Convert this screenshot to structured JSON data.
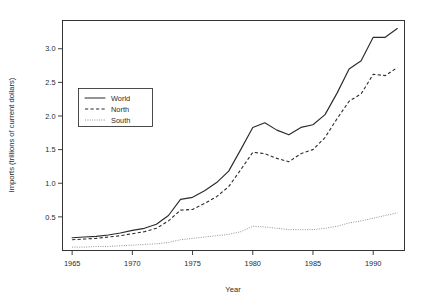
{
  "chart_data": {
    "type": "line",
    "title": "",
    "xlabel": "Year",
    "ylabel": "Imports (trillions of current dollars)",
    "xlim": [
      1964.2,
      1992.6
    ],
    "ylim": [
      0.0,
      3.42
    ],
    "xticks": [
      1965,
      1970,
      1975,
      1980,
      1985,
      1990
    ],
    "xtick_labels": [
      "1965",
      "1970",
      "1975",
      "1980",
      "1985",
      "1990"
    ],
    "yticks": [
      0.5,
      1.0,
      1.5,
      2.0,
      2.5,
      3.0
    ],
    "ytick_labels": [
      "0.5",
      "1.0",
      "1.5",
      "2.0",
      "2.5",
      "3.0"
    ],
    "grid": false,
    "legend_position": "upper-left-inset",
    "x": [
      1965,
      1966,
      1967,
      1968,
      1969,
      1970,
      1971,
      1972,
      1973,
      1974,
      1975,
      1976,
      1977,
      1978,
      1979,
      1980,
      1981,
      1982,
      1983,
      1984,
      1985,
      1986,
      1987,
      1988,
      1989,
      1990,
      1991,
      1992
    ],
    "series": [
      {
        "name": "World",
        "style": "solid",
        "color": "#2b2b2b",
        "values": [
          0.19,
          0.2,
          0.21,
          0.23,
          0.26,
          0.3,
          0.33,
          0.39,
          0.52,
          0.76,
          0.79,
          0.89,
          1.01,
          1.18,
          1.5,
          1.83,
          1.9,
          1.79,
          1.72,
          1.83,
          1.87,
          2.02,
          2.34,
          2.7,
          2.82,
          3.17,
          3.17,
          3.3
        ]
      },
      {
        "name": "North",
        "style": "dashed",
        "color": "#2b2b2b",
        "values": [
          0.16,
          0.17,
          0.18,
          0.2,
          0.22,
          0.25,
          0.28,
          0.33,
          0.44,
          0.6,
          0.61,
          0.7,
          0.8,
          0.95,
          1.2,
          1.46,
          1.44,
          1.37,
          1.32,
          1.44,
          1.5,
          1.68,
          1.96,
          2.22,
          2.33,
          2.62,
          2.6,
          2.72
        ]
      },
      {
        "name": "South",
        "style": "dotted",
        "color": "#8d8d8d",
        "values": [
          0.05,
          0.05,
          0.06,
          0.06,
          0.07,
          0.08,
          0.09,
          0.1,
          0.12,
          0.16,
          0.18,
          0.2,
          0.22,
          0.24,
          0.28,
          0.36,
          0.35,
          0.33,
          0.31,
          0.31,
          0.31,
          0.33,
          0.36,
          0.41,
          0.44,
          0.48,
          0.52,
          0.56
        ]
      }
    ],
    "legend": [
      {
        "label": "World",
        "style": "solid"
      },
      {
        "label": "North",
        "style": "dashed"
      },
      {
        "label": "South",
        "style": "dotted"
      }
    ]
  }
}
